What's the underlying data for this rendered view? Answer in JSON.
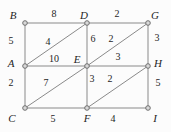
{
  "diagram": {
    "kind": "weighted-undirected-grid-graph",
    "colors": {
      "background": "#fcfcfc",
      "edge": "#8a8a8a",
      "node_fill": "#d9d9d9",
      "node_stroke": "#707070",
      "text": "#1f1f1f"
    },
    "canvas": {
      "width": 171,
      "height": 132
    },
    "nodes": [
      {
        "id": "B",
        "x": 25,
        "y": 23,
        "label_x": 13,
        "label_y": 19
      },
      {
        "id": "D",
        "x": 87,
        "y": 23,
        "label_x": 84,
        "label_y": 19
      },
      {
        "id": "G",
        "x": 148,
        "y": 23,
        "label_x": 155,
        "label_y": 19
      },
      {
        "id": "A",
        "x": 25,
        "y": 66,
        "label_x": 11,
        "label_y": 67
      },
      {
        "id": "E",
        "x": 87,
        "y": 66,
        "label_x": 77,
        "label_y": 63
      },
      {
        "id": "H",
        "x": 148,
        "y": 66,
        "label_x": 158,
        "label_y": 67
      },
      {
        "id": "C",
        "x": 25,
        "y": 108,
        "label_x": 12,
        "label_y": 122
      },
      {
        "id": "F",
        "x": 87,
        "y": 108,
        "label_x": 87,
        "label_y": 122
      },
      {
        "id": "I",
        "x": 148,
        "y": 108,
        "label_x": 155,
        "label_y": 122
      }
    ],
    "edges": [
      {
        "from": "B",
        "to": "D",
        "weight": "8",
        "label_x": 54,
        "label_y": 17
      },
      {
        "from": "D",
        "to": "G",
        "weight": "2",
        "label_x": 117,
        "label_y": 17
      },
      {
        "from": "B",
        "to": "A",
        "weight": "5",
        "label_x": 11,
        "label_y": 44
      },
      {
        "from": "A",
        "to": "C",
        "weight": "2",
        "label_x": 11,
        "label_y": 86
      },
      {
        "from": "G",
        "to": "H",
        "weight": "3",
        "label_x": 157,
        "label_y": 41
      },
      {
        "from": "H",
        "to": "I",
        "weight": "5",
        "label_x": 158,
        "label_y": 86
      },
      {
        "from": "A",
        "to": "E",
        "weight": "10",
        "label_x": 54,
        "label_y": 62
      },
      {
        "from": "E",
        "to": "H",
        "weight": "3",
        "label_x": 118,
        "label_y": 60
      },
      {
        "from": "D",
        "to": "E",
        "weight": "6",
        "label_x": 93,
        "label_y": 42
      },
      {
        "from": "E",
        "to": "F",
        "weight": "3",
        "label_x": 92,
        "label_y": 82
      },
      {
        "from": "C",
        "to": "F",
        "weight": "5",
        "label_x": 53,
        "label_y": 122
      },
      {
        "from": "F",
        "to": "I",
        "weight": "4",
        "label_x": 113,
        "label_y": 122
      },
      {
        "from": "A",
        "to": "D",
        "weight": "4",
        "label_x": 48,
        "label_y": 45
      },
      {
        "from": "E",
        "to": "G",
        "weight": "2",
        "label_x": 111,
        "label_y": 42
      },
      {
        "from": "C",
        "to": "E",
        "weight": "7",
        "label_x": 46,
        "label_y": 86
      },
      {
        "from": "F",
        "to": "H",
        "weight": "2",
        "label_x": 110,
        "label_y": 82
      }
    ]
  }
}
